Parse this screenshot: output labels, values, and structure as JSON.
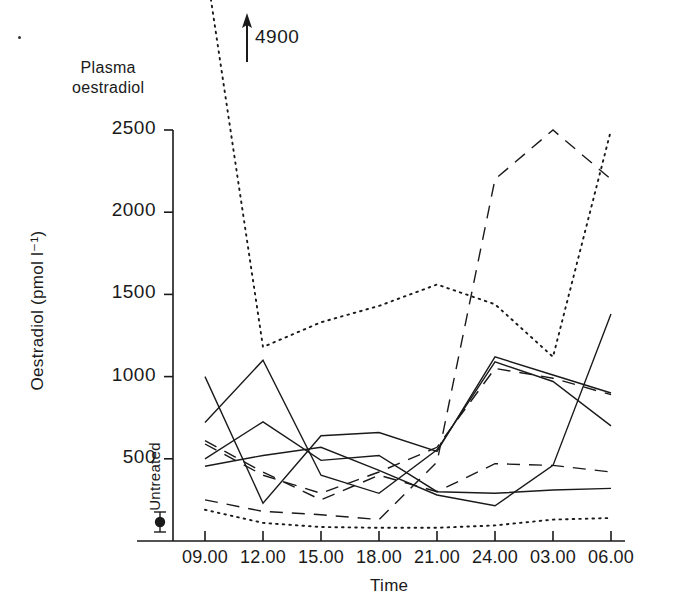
{
  "figure": {
    "panel_title": "Plasma\noestradiol",
    "panel_title_line1": "Plasma",
    "panel_title_line2": "oestradiol",
    "annotation_4900": "4900",
    "untreated_label": "Untreated"
  },
  "chart_data": {
    "type": "line",
    "xlabel": "Time",
    "ylabel": "Oestradiol (pmol l⁻¹)",
    "x": [
      "09.00",
      "12.00",
      "15.00",
      "18.00",
      "21.00",
      "24.00",
      "03.00",
      "06.00"
    ],
    "xtick_labels": [
      "09.00",
      "12.00",
      "15.00",
      "18.00",
      "21.00",
      "24.00",
      "03.00",
      "06.00"
    ],
    "ytick_labels": [
      "500",
      "1000",
      "1500",
      "2000",
      "2500"
    ],
    "yticks": [
      500,
      1000,
      1500,
      2000,
      2500
    ],
    "ylim": [
      0,
      2560
    ],
    "grid": false,
    "legend": false,
    "annotations": [
      {
        "text": "4900",
        "x": "09.00",
        "value": 4900,
        "note": "off-scale value indicated by upward arrow"
      },
      {
        "text": "Untreated",
        "x": "untreated",
        "value": 60,
        "note": "baseline untreated group mean with error bar, plotted left of axis"
      }
    ],
    "untreated_point": {
      "label": "Untreated",
      "value": 60,
      "error": 40
    },
    "series": [
      {
        "name": "subject-1",
        "style": "solid",
        "values": [
          1000,
          230,
          640,
          660,
          545,
          1120,
          1010,
          900
        ]
      },
      {
        "name": "subject-2",
        "style": "solid",
        "values": [
          720,
          1100,
          400,
          290,
          555,
          1090,
          970,
          700
        ]
      },
      {
        "name": "subject-3",
        "style": "solid",
        "values": [
          455,
          520,
          570,
          430,
          280,
          215,
          460,
          1380
        ]
      },
      {
        "name": "subject-4",
        "style": "solid",
        "values": [
          500,
          725,
          490,
          520,
          300,
          290,
          310,
          320
        ]
      },
      {
        "name": "subject-5",
        "style": "dashed",
        "values": [
          610,
          420,
          250,
          400,
          300,
          470,
          460,
          420
        ]
      },
      {
        "name": "subject-6",
        "style": "dashed",
        "values": [
          590,
          400,
          290,
          420,
          570,
          1050,
          990,
          890
        ]
      },
      {
        "name": "subject-7",
        "style": "dashed",
        "values": [
          250,
          180,
          160,
          130,
          480,
          2200,
          2500,
          2200
        ]
      },
      {
        "name": "subject-8",
        "style": "dotted",
        "values": [
          4900,
          1180,
          1330,
          1430,
          1560,
          1440,
          1120,
          2500
        ]
      },
      {
        "name": "subject-9",
        "style": "dotted",
        "values": [
          190,
          110,
          85,
          80,
          80,
          95,
          130,
          140
        ]
      }
    ]
  },
  "axes_geometry": {
    "x_positions": [
      205,
      263,
      321,
      379,
      437,
      495,
      553,
      611
    ],
    "y_zero_px": 541,
    "y_2500_px": 130,
    "axis_x_px": 173
  }
}
